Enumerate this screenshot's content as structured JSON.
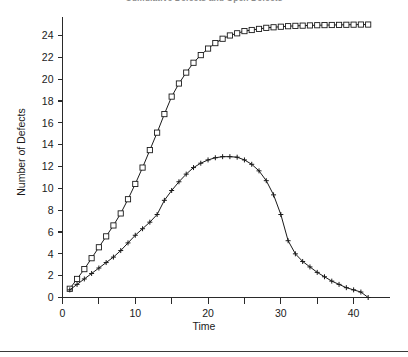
{
  "chart_data": {
    "type": "line",
    "title": "Cumulative Defects and Open Defects",
    "xlabel": "Time",
    "ylabel": "Number of Defects",
    "xlim": [
      0,
      45
    ],
    "ylim": [
      0,
      25.6
    ],
    "xticks": [
      0,
      10,
      20,
      30,
      40
    ],
    "xticks_minor": [
      5,
      15,
      25,
      35
    ],
    "yticks": [
      0,
      2,
      4,
      6,
      8,
      10,
      12,
      14,
      16,
      18,
      20,
      22,
      24
    ],
    "grid": false,
    "legend": "none",
    "series": [
      {
        "name": "Cumulative Defects",
        "marker": "square",
        "color": "#1a1a1a",
        "x": [
          1,
          2,
          3,
          4,
          5,
          6,
          7,
          8,
          9,
          10,
          11,
          12,
          13,
          14,
          15,
          16,
          17,
          18,
          19,
          20,
          21,
          22,
          23,
          24,
          25,
          26,
          27,
          28,
          29,
          30,
          31,
          32,
          33,
          34,
          35,
          36,
          37,
          38,
          39,
          40,
          41,
          42
        ],
        "values": [
          0.8,
          1.7,
          2.6,
          3.6,
          4.6,
          5.6,
          6.6,
          7.7,
          9.0,
          10.4,
          11.9,
          13.5,
          15.1,
          16.8,
          18.4,
          19.6,
          20.6,
          21.5,
          22.2,
          22.8,
          23.3,
          23.7,
          24.0,
          24.2,
          24.4,
          24.5,
          24.6,
          24.7,
          24.75,
          24.8,
          24.85,
          24.88,
          24.9,
          24.92,
          24.94,
          24.95,
          24.96,
          24.97,
          24.98,
          24.99,
          25.0,
          25.0
        ]
      },
      {
        "name": "Open Defects",
        "marker": "plus",
        "color": "#1a1a1a",
        "x": [
          1,
          2,
          3,
          4,
          5,
          6,
          7,
          8,
          9,
          10,
          11,
          12,
          13,
          14,
          15,
          16,
          17,
          18,
          19,
          20,
          21,
          22,
          23,
          24,
          25,
          26,
          27,
          28,
          29,
          30,
          31,
          32,
          33,
          34,
          35,
          36,
          37,
          38,
          39,
          40,
          41,
          42
        ],
        "values": [
          0.7,
          1.2,
          1.7,
          2.2,
          2.7,
          3.2,
          3.7,
          4.3,
          5.0,
          5.7,
          6.3,
          6.9,
          7.6,
          8.9,
          9.8,
          10.6,
          11.3,
          11.9,
          12.3,
          12.6,
          12.8,
          12.9,
          12.9,
          12.85,
          12.6,
          12.2,
          11.6,
          10.7,
          9.4,
          7.6,
          5.2,
          4.0,
          3.3,
          2.8,
          2.3,
          1.9,
          1.5,
          1.2,
          0.9,
          0.7,
          0.5,
          0.0
        ]
      }
    ]
  },
  "axes": {
    "y_title": "Number of Defects",
    "x_title": "Time"
  }
}
